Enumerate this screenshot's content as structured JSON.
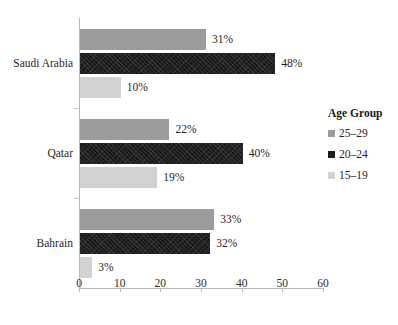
{
  "chart_data": {
    "type": "bar",
    "orientation": "horizontal",
    "title": "",
    "subtitle": "",
    "xlabel": "",
    "ylabel": "",
    "xlim": [
      0,
      60
    ],
    "xticks": [
      0,
      10,
      20,
      30,
      40,
      50,
      60
    ],
    "xtick_labels": [
      "0",
      "10",
      "20",
      "30",
      "40",
      "50",
      "60"
    ],
    "grid": false,
    "legend_position": "right",
    "legend_title": "Age Group",
    "categories": [
      "Saudi Arabia",
      "Qatar",
      "Bahrain"
    ],
    "series": [
      {
        "name": "25–29",
        "color": "#9b9b9b",
        "values": [
          31,
          22,
          33
        ],
        "value_labels": [
          "31%",
          "22%",
          "33%"
        ]
      },
      {
        "name": "20–24",
        "color": "#1b1b1b",
        "values": [
          48,
          40,
          32
        ],
        "value_labels": [
          "48%",
          "40%",
          "32%"
        ]
      },
      {
        "name": "15–19",
        "color": "#d2d2d2",
        "values": [
          10,
          19,
          3
        ],
        "value_labels": [
          "10%",
          "19%",
          "3%"
        ]
      }
    ]
  },
  "legend": {
    "title": "Age Group",
    "items": [
      {
        "label": "25–29",
        "swatch": "legend-swatch-25-29"
      },
      {
        "label": "20–24",
        "swatch": "legend-swatch-20-24"
      },
      {
        "label": "15–19",
        "swatch": "legend-swatch-15-19"
      }
    ]
  }
}
